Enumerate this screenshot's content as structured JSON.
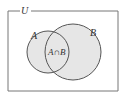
{
  "diagram": {
    "type": "venn",
    "universe_label": "U",
    "sets": [
      {
        "name": "A",
        "label": "A"
      },
      {
        "name": "B",
        "label": "B"
      }
    ],
    "intersection_label": "A∩B",
    "colors": {
      "fill": "#e6e6e6",
      "stroke": "#555555",
      "frame": "#777777",
      "background": "#ffffff"
    }
  }
}
